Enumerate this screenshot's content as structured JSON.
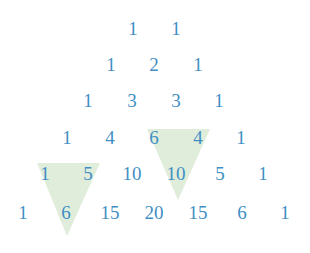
{
  "diagram": {
    "text_color": "#3f8fc4",
    "highlight_color": "#dcebd6",
    "rows": [
      [
        "1",
        "1"
      ],
      [
        "1",
        "2",
        "1"
      ],
      [
        "1",
        "3",
        "3",
        "1"
      ],
      [
        "1",
        "4",
        "6",
        "4",
        "1"
      ],
      [
        "1",
        "5",
        "10",
        "10",
        "5",
        "1"
      ],
      [
        "1",
        "6",
        "15",
        "20",
        "15",
        "6",
        "1"
      ]
    ],
    "highlights": [
      {
        "label": "1 + 5 = 6",
        "points": "37,163 100,163 67,236"
      },
      {
        "label": "6 + 4 = 10",
        "points": "147,129 210,129 178,200"
      }
    ]
  }
}
